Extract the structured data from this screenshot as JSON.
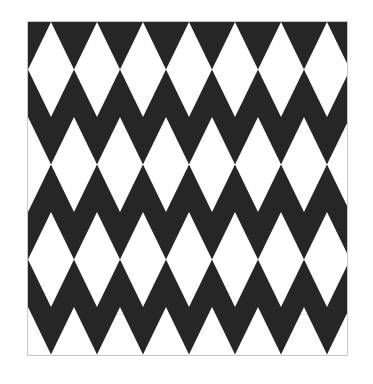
{
  "page": {
    "background_color": "#ffffff",
    "width": 373,
    "height": 384
  },
  "artwork": {
    "name": "black-and-white-triangle-tessellation",
    "description": "Repeating geometric tessellation of equilateral triangles alternating dark and white in a zig-zag grid",
    "frame": {
      "border_color": "#c9c9c9",
      "border_width": 1,
      "left": 27,
      "top": 21,
      "width": 321,
      "height": 335
    },
    "colors": {
      "dark": "#262626",
      "light": "#ffffff",
      "border": "#c9c9c9",
      "page_background": "#ffffff"
    },
    "grid": {
      "rows": 7,
      "columns": 7,
      "row_height": 47.5,
      "triangle_width": 46.0,
      "row_offset_alternates": true
    },
    "rows": [
      {
        "index": 1,
        "orientation": "down",
        "x_offset": -23,
        "count": 8
      },
      {
        "index": 2,
        "orientation": "up",
        "x_offset": -23,
        "count": 8
      },
      {
        "index": 3,
        "orientation": "down",
        "x_offset": 0,
        "count": 8
      },
      {
        "index": 4,
        "orientation": "up",
        "x_offset": 0,
        "count": 8
      },
      {
        "index": 5,
        "orientation": "down",
        "x_offset": -23,
        "count": 8
      },
      {
        "index": 6,
        "orientation": "up",
        "x_offset": -23,
        "count": 8
      },
      {
        "index": 7,
        "orientation": "down",
        "x_offset": 0,
        "count": 8
      }
    ]
  }
}
